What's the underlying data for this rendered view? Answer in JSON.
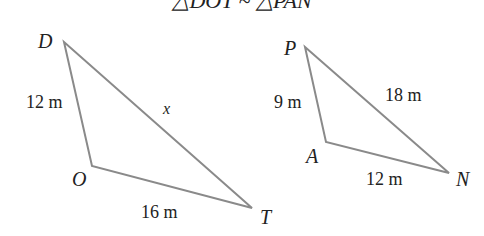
{
  "title": "△DOT ~ △PAN",
  "colors": {
    "stroke": "#8a8a8a",
    "text": "#222222",
    "background": "#ffffff"
  },
  "triangles": [
    {
      "name": "DOT",
      "vertices": {
        "D": [
          64,
          42
        ],
        "O": [
          92,
          166
        ],
        "T": [
          252,
          208
        ]
      },
      "labels": {
        "D": "D",
        "O": "O",
        "T": "T"
      },
      "sides": {
        "DO": "12 m",
        "OT": "16 m",
        "DT": "x"
      }
    },
    {
      "name": "PAN",
      "vertices": {
        "P": [
          305,
          47
        ],
        "A": [
          326,
          142
        ],
        "N": [
          449,
          173
        ]
      },
      "labels": {
        "P": "P",
        "A": "A",
        "N": "N"
      },
      "sides": {
        "PA": "9 m",
        "AN": "12 m",
        "PN": "18 m"
      }
    }
  ]
}
